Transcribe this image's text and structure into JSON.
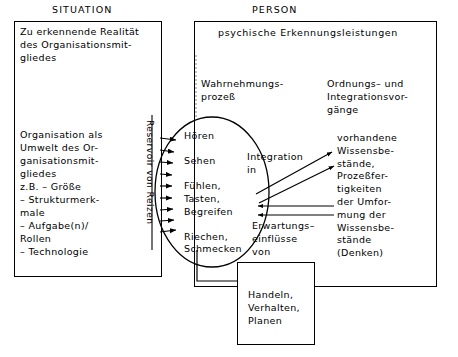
{
  "headers": {
    "situation": "SITUATION",
    "person": "PERSON"
  },
  "situation_box": {
    "block_realitaet": "Zu erkennende Realität\ndes Organisationsmit-\ngliedes",
    "block_organisation": "Organisation als\nUmwelt des Or-\nganisationsmit-\ngliedes\nz.B. – Größe\n        – Strukturmerk-\n           male\n        – Aufgabe(n)/\n           Rollen\n        – Technologie"
  },
  "reservoir": {
    "label": "Reservoir von Reizen",
    "arrow_count": 9,
    "direction": "left-to-right"
  },
  "person_box": {
    "title": "psychische Erkennungsleistungen",
    "wahrnehmung_label": "Wahrnehmungs-\nprozeß",
    "ordnung_label": "Ordnungs– und\nIntegrationsvor-\ngänge",
    "senses_oval": "Hören\n\nSehen\n\nFühlen,\nTasten,\nBegreifen\n\nRiechen,\nSchmecken",
    "integration_label": "Integration\n    in",
    "erwartungs_label": "Erwartungs–\neinflüsse\nvon",
    "wissensbestaende_label": "vorhandene\nWissensbe-\nstände,\nProzeßfer-\ntigkeiten\nder Umfor-\nmung der\nWissensbe-\nstände\n(Denken)"
  },
  "handeln_box": {
    "label": "Handeln,\nVerhalten,\nPlanen"
  },
  "arrows": {
    "integration_to_knowledge": 2,
    "knowledge_to_perception": 2,
    "integration_direction": "up-right",
    "erwartungs_direction": "left"
  },
  "colors": {
    "line": "#000000",
    "text": "#000000",
    "background": "#ffffff"
  }
}
